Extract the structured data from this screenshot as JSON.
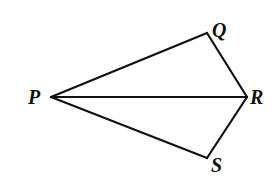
{
  "figure": {
    "type": "geometry-diagram",
    "stroke_color": "#111111",
    "background": "#ffffff",
    "vertices": [
      {
        "id": "P",
        "label": "P",
        "x": 51,
        "y": 97
      },
      {
        "id": "Q",
        "label": "Q",
        "x": 207,
        "y": 33
      },
      {
        "id": "R",
        "label": "R",
        "x": 247,
        "y": 97
      },
      {
        "id": "S",
        "label": "S",
        "x": 207,
        "y": 158
      }
    ],
    "segments": [
      {
        "from": "P",
        "to": "Q"
      },
      {
        "from": "Q",
        "to": "R"
      },
      {
        "from": "P",
        "to": "R"
      },
      {
        "from": "P",
        "to": "S"
      },
      {
        "from": "S",
        "to": "R"
      }
    ],
    "labels": {
      "P": "P",
      "Q": "Q",
      "R": "R",
      "S": "S"
    }
  }
}
